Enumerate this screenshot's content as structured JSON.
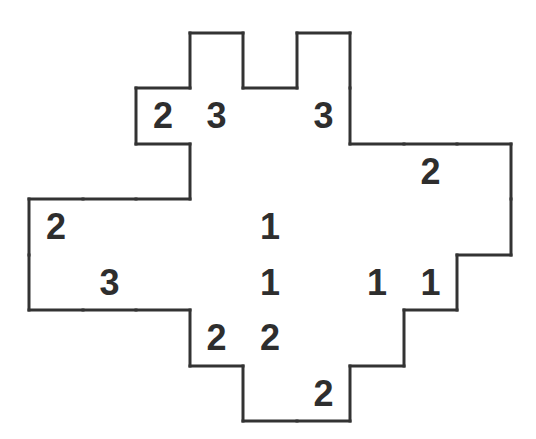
{
  "puzzle": {
    "type": "number-grid-puzzle",
    "cols": 9,
    "rows": 7,
    "col_edges": [
      29,
      83,
      136,
      190,
      243,
      297,
      350,
      404,
      457,
      511
    ],
    "row_edges": [
      33,
      88,
      144,
      199,
      255,
      310,
      366,
      421
    ],
    "colors": {
      "background": "#ffffff",
      "border": "#333333",
      "grid_line": "#9a9a9a",
      "digit": "#2e2e2e"
    },
    "rows_data": [
      {
        "row": 0,
        "cells": [
          {
            "c": 3,
            "v": ""
          },
          {
            "c": 5,
            "v": ""
          }
        ]
      },
      {
        "row": 1,
        "cells": [
          {
            "c": 2,
            "v": "2"
          },
          {
            "c": 3,
            "v": "3"
          },
          {
            "c": 4,
            "v": ""
          },
          {
            "c": 5,
            "v": "3"
          }
        ]
      },
      {
        "row": 2,
        "cells": [
          {
            "c": 3,
            "v": ""
          },
          {
            "c": 4,
            "v": ""
          },
          {
            "c": 5,
            "v": ""
          },
          {
            "c": 6,
            "v": ""
          },
          {
            "c": 7,
            "v": "2"
          },
          {
            "c": 8,
            "v": ""
          }
        ]
      },
      {
        "row": 3,
        "cells": [
          {
            "c": 0,
            "v": "2"
          },
          {
            "c": 1,
            "v": ""
          },
          {
            "c": 2,
            "v": ""
          },
          {
            "c": 3,
            "v": ""
          },
          {
            "c": 4,
            "v": "1"
          },
          {
            "c": 5,
            "v": ""
          },
          {
            "c": 6,
            "v": ""
          },
          {
            "c": 7,
            "v": ""
          },
          {
            "c": 8,
            "v": ""
          }
        ]
      },
      {
        "row": 4,
        "cells": [
          {
            "c": 0,
            "v": ""
          },
          {
            "c": 1,
            "v": "3"
          },
          {
            "c": 2,
            "v": ""
          },
          {
            "c": 3,
            "v": ""
          },
          {
            "c": 4,
            "v": "1"
          },
          {
            "c": 5,
            "v": ""
          },
          {
            "c": 6,
            "v": "1"
          },
          {
            "c": 7,
            "v": "1"
          }
        ]
      },
      {
        "row": 5,
        "cells": [
          {
            "c": 3,
            "v": "2"
          },
          {
            "c": 4,
            "v": "2"
          },
          {
            "c": 5,
            "v": ""
          },
          {
            "c": 6,
            "v": ""
          }
        ]
      },
      {
        "row": 6,
        "cells": [
          {
            "c": 4,
            "v": ""
          },
          {
            "c": 5,
            "v": "2"
          }
        ]
      }
    ]
  }
}
